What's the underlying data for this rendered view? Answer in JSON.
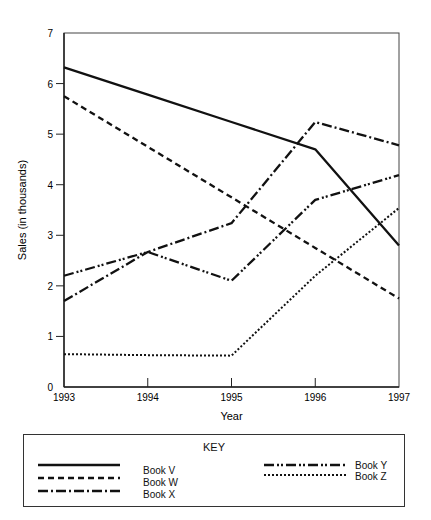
{
  "chart_data": {
    "type": "line",
    "title": "",
    "xlabel": "Year",
    "ylabel": "Sales (in thousands)",
    "x": [
      1993,
      1994,
      1995,
      1996,
      1997
    ],
    "x_tick_labels": [
      "1993",
      "1994",
      "1995",
      "1996",
      "1997"
    ],
    "y_tick_labels": [
      "0",
      "1",
      "2",
      "3",
      "4",
      "5",
      "6",
      "7"
    ],
    "ylim": [
      0,
      7
    ],
    "grid": false,
    "legend_position": "bottom box",
    "legend_title": "KEY",
    "series": [
      {
        "name": "Book V",
        "style": "solid",
        "values": [
          6.32,
          5.78,
          5.24,
          4.7,
          2.8
        ]
      },
      {
        "name": "Book W",
        "style": "dashed",
        "values": [
          5.75,
          4.75,
          3.75,
          2.75,
          1.75
        ]
      },
      {
        "name": "Book X",
        "style": "dash-dot",
        "values": [
          1.7,
          2.67,
          3.24,
          5.24,
          4.78
        ]
      },
      {
        "name": "Book Y",
        "style": "dash-dot-dot",
        "values": [
          2.2,
          2.67,
          2.1,
          3.7,
          4.19
        ]
      },
      {
        "name": "Book Z",
        "style": "dotted",
        "values": [
          0.65,
          0.63,
          0.62,
          2.2,
          3.54
        ]
      }
    ]
  },
  "legend": {
    "title": "KEY",
    "items": [
      "Book V",
      "Book W",
      "Book X",
      "Book Y",
      "Book Z"
    ]
  }
}
